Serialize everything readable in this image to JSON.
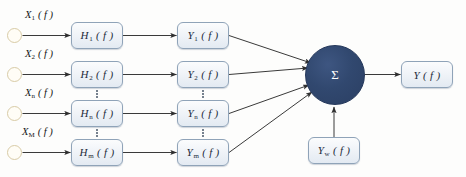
{
  "diagram": {
    "background_color": "#fdfdfc",
    "colors": {
      "box_fill": "#eef2f7",
      "box_border": "#8fa3b8",
      "source_circle_border": "#d8cba6",
      "source_circle_fill": "#fffdf6",
      "sum_node_fill": "#2b3f63",
      "sum_node_text": "#ffffff",
      "arrow": "#3a3a3a",
      "text": "#161616"
    },
    "sources": [
      {
        "name": "source-1",
        "symbol": "X",
        "subscript": "1",
        "arg": "( f )"
      },
      {
        "name": "source-2",
        "symbol": "X",
        "subscript": "2",
        "arg": "( f )"
      },
      {
        "name": "source-n",
        "symbol": "X",
        "subscript": "n",
        "arg": "( f )"
      },
      {
        "name": "source-M",
        "symbol": "X",
        "subscript": "M",
        "arg": "( f )"
      }
    ],
    "transfer_blocks": [
      {
        "name": "transfer-1",
        "symbol": "H",
        "subscript": "1",
        "arg": "( f )"
      },
      {
        "name": "transfer-2",
        "symbol": "H",
        "subscript": "2",
        "arg": "( f )"
      },
      {
        "name": "transfer-n",
        "symbol": "H",
        "subscript": "n",
        "arg": "( f )"
      },
      {
        "name": "transfer-m",
        "symbol": "H",
        "subscript": "m",
        "arg": "( f )"
      }
    ],
    "output_blocks": [
      {
        "name": "output-1",
        "symbol": "Y",
        "subscript": "1",
        "arg": "( f )"
      },
      {
        "name": "output-2",
        "symbol": "Y",
        "subscript": "2",
        "arg": "( f )"
      },
      {
        "name": "output-n",
        "symbol": "Y",
        "subscript": "n",
        "arg": "( f )"
      },
      {
        "name": "output-m",
        "symbol": "Y",
        "subscript": "m",
        "arg": "( f )"
      }
    ],
    "noise_block": {
      "name": "noise",
      "symbol": "Y",
      "subscript": "w",
      "arg": "( f )"
    },
    "summation_node": {
      "name": "summation",
      "glyph": "Σ"
    },
    "final_output": {
      "name": "final-output",
      "symbol": "Y",
      "subscript": "",
      "arg": "( f )"
    },
    "ellipsis_glyph": "⋮"
  }
}
